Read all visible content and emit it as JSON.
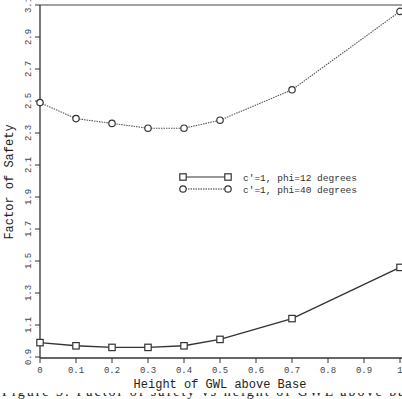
{
  "chart_data": {
    "type": "line",
    "title": "",
    "xlabel": "Height of GWL above Base",
    "ylabel": "Factor of Safety",
    "x": [
      0,
      0.1,
      0.2,
      0.3,
      0.4,
      0.5,
      0.7,
      1.0
    ],
    "series": [
      {
        "name": "c'=1, phi=12 degrees",
        "marker": "square",
        "line_style": "solid",
        "values": [
          0.99,
          0.97,
          0.96,
          0.96,
          0.97,
          1.01,
          1.14,
          1.46
        ]
      },
      {
        "name": "c'=1, phi=40 degrees",
        "marker": "circle",
        "line_style": "dotted",
        "values": [
          2.49,
          2.39,
          2.36,
          2.33,
          2.33,
          2.38,
          2.57,
          3.06
        ]
      }
    ],
    "xlim": [
      0,
      1
    ],
    "ylim": [
      0.9,
      3.1
    ],
    "x_ticks": [
      "0",
      "0.1",
      "0.2",
      "0.3",
      "0.4",
      "0.5",
      "0.6",
      "0.7",
      "0.8",
      "0.9",
      "1"
    ],
    "y_ticks": [
      "0.9",
      "1.1",
      "1.3",
      "1.5",
      "1.7",
      "1.9",
      "2.1",
      "2.3",
      "2.5",
      "2.7",
      "2.9",
      "3.1"
    ],
    "grid": false,
    "legend_position": "center-right inside plot"
  },
  "caption_partial": "Figure 3: Factor of safety vs height of GWL above base"
}
